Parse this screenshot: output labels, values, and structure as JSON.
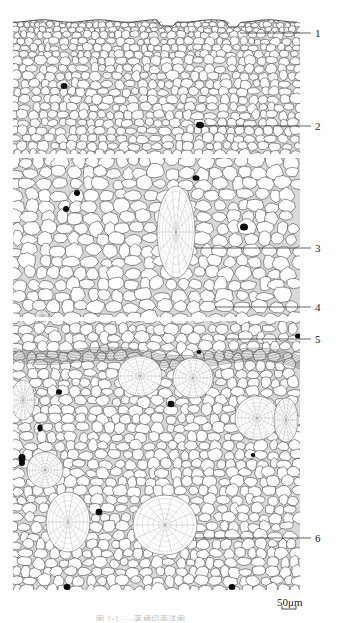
{
  "figure": {
    "type": "botanical line drawing",
    "panels": 3,
    "labels": [
      {
        "id": "1",
        "text": "1",
        "y": 33,
        "target_x": 240
      },
      {
        "id": "2",
        "text": "2",
        "y": 126,
        "target_x": 200
      },
      {
        "id": "3",
        "text": "3",
        "y": 248,
        "target_x": 195
      },
      {
        "id": "4",
        "text": "4",
        "y": 307,
        "target_x": 215
      },
      {
        "id": "5",
        "text": "5",
        "y": 339,
        "target_x": 225
      },
      {
        "id": "6",
        "text": "6",
        "y": 538,
        "target_x": 195
      }
    ],
    "scale_bar": {
      "text": "50μm"
    },
    "caption": {
      "text": "图 1-1  ····茎横切面详图"
    },
    "colors": {
      "line": "#3a3a3a",
      "cell_fill": "#ffffff",
      "cavity": "#0a0a0a",
      "background": "#ffffff"
    }
  }
}
